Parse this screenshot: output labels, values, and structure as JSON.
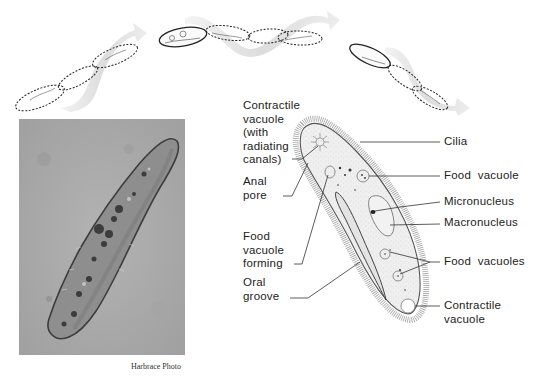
{
  "figure": {
    "swimming_path": {
      "description": "Spiral swimming path of paramecium shown in three stages with dashed outlines and arrows"
    },
    "photo": {
      "caption": "Harbrace Photo"
    },
    "diagram": {
      "left_labels": [
        {
          "lines": [
            "Contractile",
            "vacuole",
            "(with",
            "radiating",
            "canals)"
          ]
        },
        {
          "lines": [
            "Anal",
            "pore"
          ]
        },
        {
          "lines": [
            "Food",
            "vacuole",
            "forming"
          ]
        },
        {
          "lines": [
            "Oral",
            "groove"
          ]
        }
      ],
      "right_labels": [
        {
          "text": "Cilia"
        },
        {
          "text": "Food  vacuole"
        },
        {
          "text": "Micronucleus"
        },
        {
          "text": "Macronucleus"
        },
        {
          "text": "Food  vacuoles"
        },
        {
          "lines": [
            "Contractile",
            "vacuole"
          ]
        }
      ]
    }
  }
}
